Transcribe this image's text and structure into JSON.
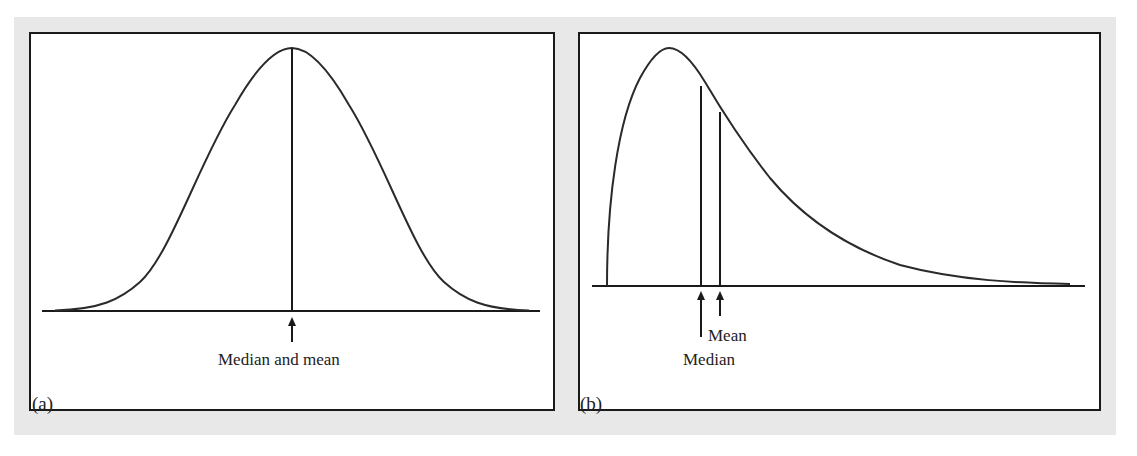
{
  "figure": {
    "panels": [
      {
        "id": "a",
        "caption": "(a)",
        "distribution": "symmetric (normal)",
        "annotation": "Median and mean"
      },
      {
        "id": "b",
        "caption": "(b)",
        "distribution": "right-skewed",
        "annotations": {
          "mean": "Mean",
          "median": "Median"
        }
      }
    ]
  },
  "colors": {
    "background_band": "#e8e8e8",
    "panel_background": "#ffffff",
    "stroke": "#1a1a1a"
  }
}
